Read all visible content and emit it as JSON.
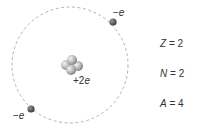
{
  "diagram": {
    "type": "helium-atom-model",
    "nucleus": {
      "charge_label_num": "+2",
      "charge_label_unit": "e"
    },
    "electrons": [
      {
        "label_sign": "−",
        "label_unit": "e",
        "position": "upper-right"
      },
      {
        "label_sign": "−",
        "label_unit": "e",
        "position": "lower-left"
      }
    ],
    "quantities": [
      {
        "symbol": "Z",
        "eq": " = ",
        "value": "2"
      },
      {
        "symbol": "N",
        "eq": " = ",
        "value": "2"
      },
      {
        "symbol": "A",
        "eq": " = ",
        "value": "4"
      }
    ],
    "colors": {
      "orbit": "#aaaaaa",
      "electron": "#555555",
      "nucleon": "#bbbbbb",
      "text": "#333333"
    }
  }
}
